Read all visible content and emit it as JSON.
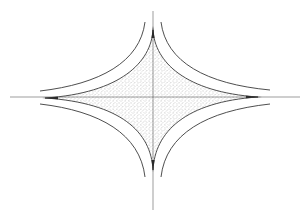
{
  "figure": {
    "type": "astroid-diagram",
    "colors": {
      "background": "#ffffff",
      "line": "#3a3a3a",
      "axis": "#5a5a5a",
      "stipple": "#8a8a8a"
    },
    "center": [
      153,
      97
    ],
    "axes": {
      "horizontal": {
        "x1": 10,
        "x2": 300,
        "y": 97
      },
      "vertical": {
        "x": 153,
        "y1": 11,
        "y2": 210
      }
    },
    "astroid": {
      "cusps": {
        "top": [
          153,
          30
        ],
        "bottom": [
          153,
          170
        ],
        "left": [
          45,
          98
        ],
        "right": [
          258,
          97
        ]
      }
    },
    "outer_curves": [
      {
        "name": "upper-left",
        "from": [
          40,
          92
        ],
        "to": [
          145,
          22
        ]
      },
      {
        "name": "upper-right",
        "from": [
          162,
          22
        ],
        "to": [
          270,
          90
        ]
      },
      {
        "name": "lower-left",
        "from": [
          40,
          103
        ],
        "to": [
          145,
          177
        ]
      },
      {
        "name": "lower-right",
        "from": [
          162,
          177
        ],
        "to": [
          270,
          103
        ]
      }
    ]
  }
}
